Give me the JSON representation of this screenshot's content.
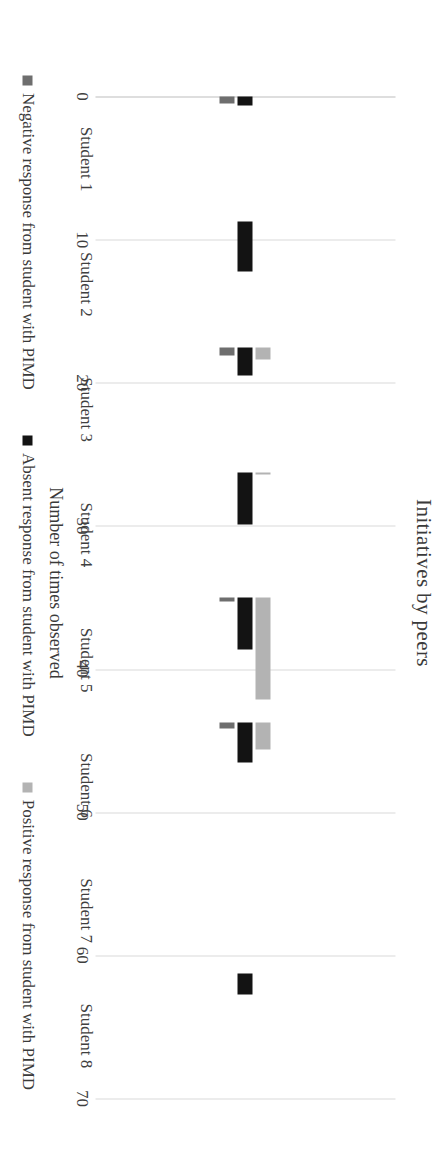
{
  "chart_data": {
    "type": "bar",
    "orientation": "vertical",
    "title": "Initiatives by peers",
    "xlabel": "",
    "ylabel": "Number of times observed",
    "categories": [
      "Student 1",
      "Student 2",
      "Student 3",
      "Student 4",
      "Student 5",
      "Student 6",
      "Student 7",
      "Student 8"
    ],
    "series": [
      {
        "name": "Negative response from student with PIMD",
        "color": "#6e6e6e",
        "values": [
          4,
          0,
          5,
          0,
          2,
          3,
          0,
          0
        ]
      },
      {
        "name": "Absent response from student with PIMD",
        "color": "#131313",
        "values": [
          5,
          28,
          16,
          29,
          29,
          22,
          0,
          12
        ]
      },
      {
        "name": "Positive response from student with PIMD",
        "color": "#b3b3b3",
        "values": [
          0,
          0,
          7,
          1,
          57,
          15,
          0,
          0
        ]
      }
    ],
    "ylim": [
      0,
      70
    ],
    "yticks": [
      0,
      10,
      20,
      30,
      40,
      50,
      60,
      70
    ],
    "grid": true,
    "legend_position": "bottom"
  }
}
